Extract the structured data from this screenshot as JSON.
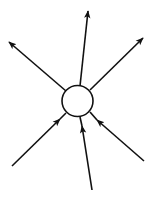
{
  "diagram": {
    "type": "node-with-arrows",
    "colors": {
      "stroke": "#111111",
      "background": "#ffffff",
      "node_fill": "#ffffff"
    },
    "node": {
      "shape": "circle",
      "cx": 77.5,
      "cy": 101,
      "r": 15.5,
      "label": ""
    },
    "outgoing_arrows": [
      {
        "name": "arrow-out-up",
        "from": [
          80,
          86
        ],
        "to": [
          88,
          11
        ]
      },
      {
        "name": "arrow-out-up-left",
        "from": [
          66,
          91
        ],
        "to": [
          9,
          42
        ]
      },
      {
        "name": "arrow-out-up-right",
        "from": [
          90,
          90
        ],
        "to": [
          143,
          38
        ]
      }
    ],
    "incoming_arrows": [
      {
        "name": "arrow-in-bottom-left",
        "tail": [
          12,
          166
        ],
        "head": [
          60,
          119
        ],
        "end": [
          66,
          113
        ]
      },
      {
        "name": "arrow-in-bottom",
        "tail": [
          92,
          190
        ],
        "head": [
          82,
          126
        ],
        "end": [
          80,
          117
        ]
      },
      {
        "name": "arrow-in-bottom-right",
        "tail": [
          144,
          161
        ],
        "head": [
          97,
          120
        ],
        "end": [
          90,
          112
        ]
      }
    ]
  }
}
